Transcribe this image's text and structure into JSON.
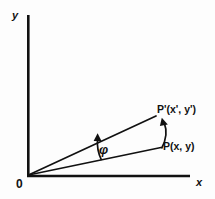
{
  "figure": {
    "background_color": "#fdfdfd",
    "stroke_color": "#111111"
  },
  "axes": {
    "y_label": "y",
    "x_label": "x",
    "origin_label": "0",
    "y_axis": {
      "x1": 28,
      "y1": 15,
      "x2": 28,
      "y2": 176
    },
    "x_axis": {
      "x1": 27,
      "y1": 176,
      "x2": 190,
      "y2": 176
    }
  },
  "points": {
    "origin": {
      "label": "0",
      "x": 28,
      "y": 176
    },
    "p": {
      "label": "P(x, y)",
      "x": 160,
      "y": 147
    },
    "p_prime": {
      "label": "P'(x', y')",
      "x": 155,
      "y": 116
    }
  },
  "vectors": [
    {
      "name": "ray-to-p",
      "from": [
        28,
        176
      ],
      "to": [
        160,
        147
      ]
    },
    {
      "name": "ray-to-p-prime",
      "from": [
        28,
        176
      ],
      "to": [
        155,
        116
      ]
    }
  ],
  "angle": {
    "symbol": "φ",
    "name": "phi",
    "description": "rotation angle between ray OP and ray OP'"
  },
  "arcs": [
    {
      "name": "angle-arc",
      "description": "arc sweeping from ray OP up to ray OP' marking angle phi",
      "start": [
        100,
        159
      ],
      "end": [
        98,
        136
      ]
    },
    {
      "name": "rotation-arc",
      "description": "arc from P curving to P' showing the rotation of the point",
      "start": [
        161,
        148
      ],
      "end": [
        156,
        118
      ]
    }
  ]
}
